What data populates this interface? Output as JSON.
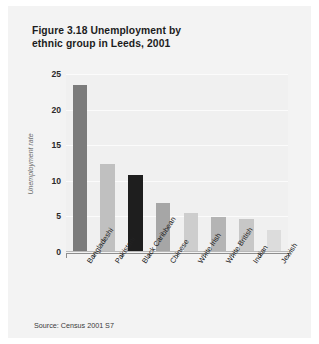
{
  "figure": {
    "title": "Figure 3.18  Unemployment by ethnic group in Leeds, 2001",
    "title_line1": "Figure 3.18  Unemployment by",
    "title_line2": "ethnic group in Leeds, 2001",
    "source": "Source: Census 2001 S7",
    "panel_background": "#f3f3f3",
    "plot_background": "#f0f0f0"
  },
  "chart_data": {
    "type": "bar",
    "title": "Figure 3.18  Unemployment by ethnic group in Leeds, 2001",
    "xlabel": "",
    "ylabel": "Unemployment rate",
    "categories": [
      "Bangladeshi",
      "Pakistani",
      "Black Caribbean",
      "Chinese",
      "White Irish",
      "White British",
      "Indian",
      "Jewish"
    ],
    "values": [
      23.5,
      12.3,
      10.8,
      6.9,
      5.5,
      4.9,
      4.6,
      3.1
    ],
    "bar_colors": [
      "#7b7b7b",
      "#c0c0c0",
      "#1e1e1e",
      "#a6a6a6",
      "#cdcdcd",
      "#b4b4b4",
      "#c7c7c7",
      "#dcdcdc"
    ],
    "ylim": [
      0,
      25
    ],
    "yticks": [
      0,
      5,
      10,
      15,
      20,
      25
    ],
    "ytick_labels": [
      "0",
      "5",
      "10",
      "15",
      "20",
      "25"
    ],
    "grid": true,
    "grid_color": "#fbfbfb",
    "legend": null,
    "legend_position": "none",
    "axis_color": "#8e8e8e"
  }
}
